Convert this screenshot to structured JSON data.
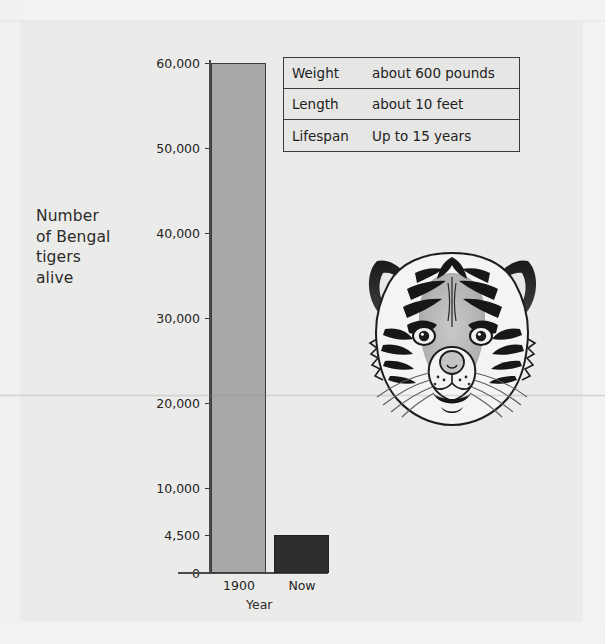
{
  "chart_data": {
    "type": "bar",
    "title": "",
    "xlabel": "Year",
    "ylabel": "Number of Bengal tigers alive",
    "categories": [
      "1900",
      "Now"
    ],
    "values": [
      60000,
      4500
    ],
    "ylim": [
      0,
      60000
    ],
    "ytick_labels": [
      "60,000",
      "50,000",
      "40,000",
      "30,000",
      "20,000",
      "10,000",
      "4,500",
      "0"
    ],
    "ytick_values": [
      60000,
      50000,
      40000,
      30000,
      20000,
      10000,
      4500,
      0
    ],
    "grid": false,
    "legend": "none",
    "bar_colors": [
      "#a8a8a8",
      "#2e2e2e"
    ]
  },
  "axis": {
    "y_label_lines": [
      "Number",
      "of Bengal",
      "tigers",
      "alive"
    ],
    "x_label": "Year"
  },
  "facts_table": {
    "rows": [
      {
        "key": "Weight",
        "value": "about 600 pounds"
      },
      {
        "key": "Length",
        "value": "about 10 feet"
      },
      {
        "key": "Lifespan",
        "value": "Up to 15 years"
      }
    ]
  },
  "illustration": {
    "name": "bengal-tiger-head"
  },
  "colors": {
    "page_background": "#ebebe9",
    "bar_1900": "#a8a8a8",
    "bar_now": "#2e2e2e",
    "axis": "#4a4a4a",
    "text": "#232323"
  }
}
